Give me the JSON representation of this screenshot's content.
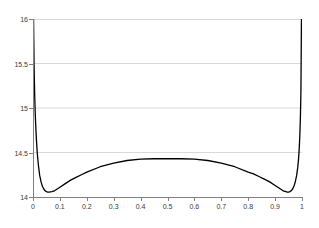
{
  "chart_data": {
    "type": "line",
    "title": "",
    "xlabel": "",
    "ylabel": "",
    "xlim": [
      0,
      1
    ],
    "ylim": [
      14,
      16
    ],
    "grid": true,
    "legend": "none",
    "x_ticks": [
      "0",
      "0.1",
      "0.2",
      "0.3",
      "0.4",
      "0.5",
      "0.6",
      "0.7",
      "0.8",
      "0.9",
      "1"
    ],
    "x_tick_values": [
      0,
      0.1,
      0.2,
      0.3,
      0.4,
      0.5,
      0.6,
      0.7,
      0.8,
      0.9,
      1
    ],
    "y_ticks": [
      "14",
      "14.5",
      "15",
      "15.5",
      "16"
    ],
    "y_tick_values": [
      14,
      14.5,
      15,
      15.5,
      16
    ],
    "line_color": "#000000",
    "grid_color": "#d9d9d9",
    "axis_color": "#808080",
    "series": [
      {
        "name": "curve",
        "x": [
          0.002,
          0.004,
          0.006,
          0.008,
          0.01,
          0.013,
          0.016,
          0.02,
          0.025,
          0.03,
          0.035,
          0.04,
          0.045,
          0.05,
          0.055,
          0.06,
          0.07,
          0.08,
          0.09,
          0.1,
          0.12,
          0.14,
          0.16,
          0.18,
          0.2,
          0.25,
          0.3,
          0.35,
          0.4,
          0.45,
          0.5,
          0.55,
          0.6,
          0.65,
          0.7,
          0.75,
          0.8,
          0.82,
          0.84,
          0.86,
          0.88,
          0.9,
          0.91,
          0.92,
          0.93,
          0.94,
          0.945,
          0.95,
          0.955,
          0.96,
          0.965,
          0.97,
          0.975,
          0.98,
          0.984,
          0.987,
          0.99,
          0.992,
          0.994,
          0.996,
          0.998
        ],
        "y": [
          16.0,
          15.48,
          15.18,
          14.97,
          14.81,
          14.63,
          14.49,
          14.36,
          14.24,
          14.17,
          14.12,
          14.09,
          14.07,
          14.06,
          14.055,
          14.055,
          14.06,
          14.07,
          14.09,
          14.11,
          14.15,
          14.19,
          14.22,
          14.25,
          14.28,
          14.34,
          14.38,
          14.41,
          14.425,
          14.43,
          14.432,
          14.43,
          14.425,
          14.41,
          14.38,
          14.34,
          14.28,
          14.26,
          14.23,
          14.2,
          14.17,
          14.13,
          14.11,
          14.09,
          14.07,
          14.06,
          14.055,
          14.055,
          14.06,
          14.07,
          14.09,
          14.12,
          14.17,
          14.24,
          14.33,
          14.42,
          14.56,
          14.7,
          14.89,
          15.18,
          16.0
        ]
      }
    ]
  }
}
